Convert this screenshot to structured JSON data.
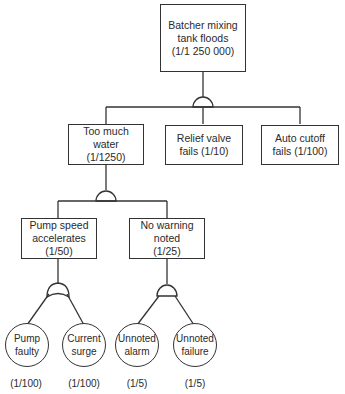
{
  "diagram": {
    "type": "fault-tree",
    "top_event": {
      "line1": "Batcher mixing",
      "line2": "tank floods",
      "probability": "(1/1 250 000)",
      "gate": "AND"
    },
    "level2": [
      {
        "line1": "Too much",
        "line2": "water",
        "probability": "(1/1250)",
        "gate": "AND"
      },
      {
        "line1": "Relief valve",
        "line2": "fails (1/10)"
      },
      {
        "line1": "Auto cutoff",
        "line2": "fails (1/100)"
      }
    ],
    "level3": [
      {
        "line1": "Pump speed",
        "line2": "accelerates",
        "probability": "(1/50)",
        "gate": "OR"
      },
      {
        "line1": "No warning",
        "line2": "noted",
        "probability": "(1/25)",
        "gate": "AND"
      }
    ],
    "basic_events": [
      {
        "line1": "Pump",
        "line2": "faulty",
        "probability": "(1/100)"
      },
      {
        "line1": "Current",
        "line2": "surge",
        "probability": "(1/100)"
      },
      {
        "line1": "Unnoted",
        "line2": "alarm",
        "probability": "(1/5)"
      },
      {
        "line1": "Unnoted",
        "line2": "failure",
        "probability": "(1/5)"
      }
    ]
  }
}
